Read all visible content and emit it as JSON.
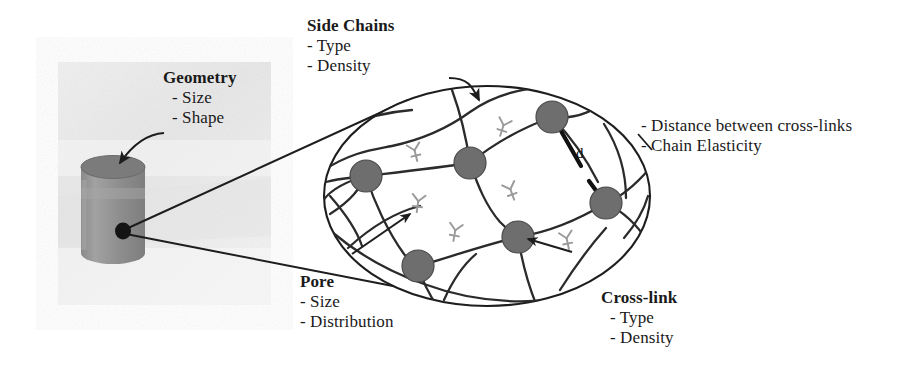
{
  "figure": {
    "width": 920,
    "height": 370,
    "background_color": "#ffffff"
  },
  "colors": {
    "ink": "#1a1a1a",
    "chain_stroke": "#2b2b2b",
    "node_fill": "#6e6e6e",
    "node_stroke": "#3a3a3a",
    "side_chain": "#9a9a9a",
    "photo_bg": "#ededed",
    "cylinder_body": "#8f8f8f",
    "cylinder_top": "#7a7a7a",
    "cylinder_highlight": "#a3a3a3",
    "distance_line": "#111111"
  },
  "photo_panel": {
    "name": "scaffold-photograph",
    "x": 58,
    "y": 62,
    "width": 213,
    "height": 243
  },
  "labels": {
    "geometry": {
      "title": "Geometry",
      "items": [
        "- Size",
        "- Shape"
      ],
      "x": 163,
      "y": 68
    },
    "side_chains": {
      "title": "Side Chains",
      "items": [
        "- Type",
        "- Density"
      ],
      "x": 307,
      "y": 16
    },
    "pore": {
      "title": "Pore",
      "items": [
        "- Size",
        "- Distribution"
      ],
      "x": 300,
      "y": 272
    },
    "cross_link": {
      "title": "Cross-link",
      "items": [
        "- Type",
        "- Density"
      ],
      "x": 601,
      "y": 288
    },
    "chain_properties": {
      "items": [
        "- Distance between cross-links",
        "- Chain Elasticity"
      ],
      "x": 641,
      "y": 116
    },
    "distance_marker": {
      "text": "d",
      "x": 576,
      "y": 145
    }
  },
  "network": {
    "ellipse": {
      "cx": 487,
      "cy": 196,
      "rx": 163,
      "ry": 110
    },
    "nodes": [
      {
        "id": "node-upper-right",
        "cx": 552,
        "cy": 117,
        "r": 16
      },
      {
        "id": "node-center-top",
        "cx": 470,
        "cy": 163,
        "r": 16
      },
      {
        "id": "node-left",
        "cx": 366,
        "cy": 176,
        "r": 16
      },
      {
        "id": "node-right",
        "cx": 606,
        "cy": 203,
        "r": 16
      },
      {
        "id": "node-center-bottom",
        "cx": 518,
        "cy": 237,
        "r": 16
      },
      {
        "id": "node-lower-left",
        "cx": 418,
        "cy": 266,
        "r": 16
      }
    ],
    "node_count": 6,
    "side_chain_count": 6
  },
  "annotations": {
    "side_chain_arrow": "curved arrow from Side Chains label to a side-chain glyph",
    "pore_arrow": "arrow pointing into an open pore region",
    "cross_link_arrow": "arrow pointing to a cross-link node",
    "geometry_arrow": "curved arrow pointing to the cylinder top face",
    "magnifier_leaders": "two straight leader lines from cylinder to network ellipse"
  }
}
